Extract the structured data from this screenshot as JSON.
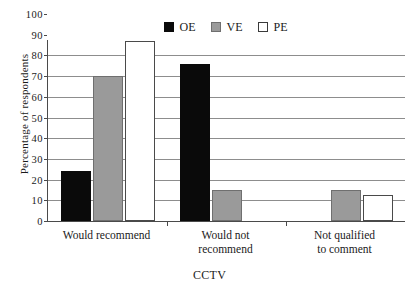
{
  "chart_data": {
    "type": "bar",
    "title": "",
    "xlabel": "CCTV",
    "ylabel": "Percentage of respondents",
    "categories": [
      "Would recommend",
      "Would not recommend",
      "Not qualified to comment"
    ],
    "series": [
      {
        "name": "OE",
        "color": "#0a0a0a",
        "values": [
          24,
          76,
          0
        ]
      },
      {
        "name": "VE",
        "color": "#9a9a9a",
        "values": [
          70,
          15,
          15
        ]
      },
      {
        "name": "PE",
        "color": "#ffffff",
        "values": [
          87,
          0,
          12.5
        ]
      }
    ],
    "ylim": [
      0,
      100
    ],
    "yticks": [
      0,
      10,
      20,
      30,
      40,
      50,
      60,
      70,
      80,
      90,
      100
    ],
    "ytick_labels": [
      "0",
      "10",
      "20",
      "30",
      "40",
      "50",
      "60",
      "70",
      "80",
      "90",
      "100"
    ],
    "grid": true,
    "legend_position": "top-center"
  },
  "legend": {
    "items": [
      {
        "label": "OE",
        "swatch": "black-square-icon"
      },
      {
        "label": "VE",
        "swatch": "gray-square-icon"
      },
      {
        "label": "PE",
        "swatch": "white-square-icon"
      }
    ]
  },
  "category_labels": [
    {
      "line1": "Would recommend",
      "line2": ""
    },
    {
      "line1": "Would not",
      "line2": "recommend"
    },
    {
      "line1": "Not qualified",
      "line2": "to comment"
    }
  ]
}
